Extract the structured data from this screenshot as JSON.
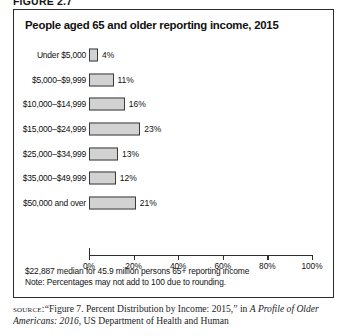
{
  "figure_number": "FIGURE 2.7",
  "chart_title": "People aged 65 and older reporting income, 2015",
  "footnotes": {
    "median_note": "$22,887 median for 45.9 million persons 65+ reporting income",
    "rounding_note": "Note: Percentages may not add to 100 due to rounding."
  },
  "source": {
    "label": "SOURCE:",
    "part1": "“Figure 7. Percent Distribution by Income: 2015,” in ",
    "italic1": "A Profile",
    "part2": " ",
    "italic2": "of Older Americans: 2016",
    "part3": ", US Department of Health and Human"
  },
  "chart_data": {
    "type": "bar",
    "orientation": "horizontal",
    "title": "People aged 65 and older reporting income, 2015",
    "xlabel": "",
    "ylabel": "",
    "xlim": [
      0,
      100
    ],
    "grid": false,
    "legend": false,
    "bar_color": "#d2d2d2",
    "bar_border_color": "#3a3a3a",
    "categories": [
      "Under $5,000",
      "$5,000–$9,999",
      "$10,000–$14,999",
      "$15,000–$24,999",
      "$25,000–$34,999",
      "$35,000–$49,999",
      "$50,000 and over"
    ],
    "values": [
      4,
      11,
      16,
      23,
      13,
      12,
      21
    ],
    "value_labels": [
      "4%",
      "11%",
      "16%",
      "23%",
      "13%",
      "12%",
      "21%"
    ],
    "xticks": [
      0,
      20,
      40,
      60,
      80,
      100
    ],
    "xtick_labels": [
      "0%",
      "20%",
      "40%",
      "60%",
      "80%",
      "100%"
    ]
  }
}
